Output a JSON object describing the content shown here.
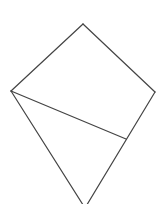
{
  "diagram": {
    "type": "geometric-figure",
    "stroke_color": "#444444",
    "background": "#ffffff",
    "stroke_width": 1.2,
    "points": {
      "top": [
        83,
        24
      ],
      "left": [
        11,
        91
      ],
      "right": [
        155,
        92
      ],
      "inner": [
        126,
        139
      ],
      "bottom": [
        85,
        208
      ]
    },
    "segments": [
      {
        "name": "top-left-edge",
        "from": "top",
        "to": "left"
      },
      {
        "name": "top-right-edge",
        "from": "top",
        "to": "right"
      },
      {
        "name": "right-lower-edge",
        "from": "right",
        "to": "bottom"
      },
      {
        "name": "left-lower-edge",
        "from": "left",
        "to": "bottom"
      },
      {
        "name": "diagonal",
        "from": "left",
        "to": "inner"
      }
    ]
  }
}
